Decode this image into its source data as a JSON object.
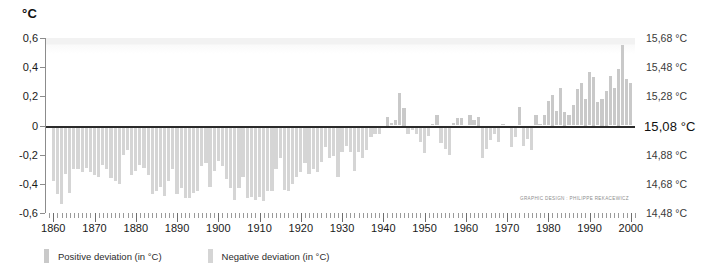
{
  "unit_label": "°C",
  "credit": "GRAPHIC DESIGN : PHILIPPE REKACEWICZ",
  "legend": {
    "items": [
      {
        "label": "Positive deviation (in °C)",
        "color": "#c9c9c9",
        "name": "positive"
      },
      {
        "label": "Negative deviation (in °C)",
        "color": "#d5d5d5",
        "name": "negative"
      }
    ]
  },
  "axes": {
    "left_ticks": [
      "0,6",
      "0,4",
      "0,2",
      "0",
      "-0,2",
      "-0,4",
      "-0,6"
    ],
    "left_values": [
      0.6,
      0.4,
      0.2,
      0,
      -0.2,
      -0.4,
      -0.6
    ],
    "right_ticks": [
      "15,68 °C",
      "15,48 °C",
      "15,28 °C",
      "15,08 °C",
      "14,88 °C",
      "14,68 °C",
      "14,48 °C"
    ],
    "right_values": [
      0.6,
      0.4,
      0.2,
      0,
      -0.2,
      -0.4,
      -0.6
    ],
    "x_ticks": [
      "1860",
      "1870",
      "1880",
      "1890",
      "1900",
      "1910",
      "1920",
      "1930",
      "1940",
      "1950",
      "1960",
      "1970",
      "1980",
      "1990",
      "2000"
    ],
    "x_values": [
      1860,
      1870,
      1880,
      1890,
      1900,
      1910,
      1920,
      1930,
      1940,
      1950,
      1960,
      1970,
      1980,
      1990,
      2000
    ]
  },
  "chart_data": {
    "type": "bar",
    "title": "",
    "xlabel": "",
    "ylabel": "°C",
    "xlim": [
      1858,
      2001
    ],
    "ylim": [
      -0.6,
      0.6
    ],
    "grid": false,
    "legend_position": "bottom-left",
    "baseline": 0,
    "baseline_absolute_temperature": 15.08,
    "secondary_axis_label": "°C",
    "x": [
      1860,
      1861,
      1862,
      1863,
      1864,
      1865,
      1866,
      1867,
      1868,
      1869,
      1870,
      1871,
      1872,
      1873,
      1874,
      1875,
      1876,
      1877,
      1878,
      1879,
      1880,
      1881,
      1882,
      1883,
      1884,
      1885,
      1886,
      1887,
      1888,
      1889,
      1890,
      1891,
      1892,
      1893,
      1894,
      1895,
      1896,
      1897,
      1898,
      1899,
      1900,
      1901,
      1902,
      1903,
      1904,
      1905,
      1906,
      1907,
      1908,
      1909,
      1910,
      1911,
      1912,
      1913,
      1914,
      1915,
      1916,
      1917,
      1918,
      1919,
      1920,
      1921,
      1922,
      1923,
      1924,
      1925,
      1926,
      1927,
      1928,
      1929,
      1930,
      1931,
      1932,
      1933,
      1934,
      1935,
      1936,
      1937,
      1938,
      1939,
      1940,
      1941,
      1942,
      1943,
      1944,
      1945,
      1946,
      1947,
      1948,
      1949,
      1950,
      1951,
      1952,
      1953,
      1954,
      1955,
      1956,
      1957,
      1958,
      1959,
      1960,
      1961,
      1962,
      1963,
      1964,
      1965,
      1966,
      1967,
      1968,
      1969,
      1970,
      1971,
      1972,
      1973,
      1974,
      1975,
      1976,
      1977,
      1978,
      1979,
      1980,
      1981,
      1982,
      1983,
      1984,
      1985,
      1986,
      1987,
      1988,
      1989,
      1990,
      1991,
      1992,
      1993,
      1994,
      1995,
      1996,
      1997,
      1998,
      1999,
      2000
    ],
    "values": [
      -0.38,
      -0.47,
      -0.54,
      -0.33,
      -0.46,
      -0.3,
      -0.3,
      -0.32,
      -0.29,
      -0.32,
      -0.34,
      -0.35,
      -0.27,
      -0.3,
      -0.36,
      -0.38,
      -0.4,
      -0.2,
      -0.17,
      -0.34,
      -0.31,
      -0.27,
      -0.29,
      -0.34,
      -0.47,
      -0.45,
      -0.42,
      -0.48,
      -0.38,
      -0.3,
      -0.47,
      -0.43,
      -0.5,
      -0.5,
      -0.46,
      -0.45,
      -0.28,
      -0.26,
      -0.42,
      -0.31,
      -0.24,
      -0.28,
      -0.37,
      -0.43,
      -0.51,
      -0.43,
      -0.35,
      -0.5,
      -0.49,
      -0.51,
      -0.49,
      -0.52,
      -0.45,
      -0.45,
      -0.3,
      -0.22,
      -0.44,
      -0.45,
      -0.4,
      -0.35,
      -0.32,
      -0.26,
      -0.33,
      -0.3,
      -0.32,
      -0.25,
      -0.15,
      -0.22,
      -0.21,
      -0.35,
      -0.18,
      -0.14,
      -0.18,
      -0.31,
      -0.18,
      -0.22,
      -0.17,
      -0.08,
      -0.06,
      -0.06,
      -0.01,
      0.06,
      0.02,
      0.04,
      0.22,
      0.12,
      -0.06,
      -0.03,
      -0.06,
      -0.11,
      -0.19,
      -0.07,
      0.01,
      0.07,
      -0.12,
      -0.16,
      -0.2,
      0.02,
      0.05,
      0.05,
      -0.01,
      0.07,
      0.04,
      0.06,
      -0.22,
      -0.16,
      -0.1,
      -0.06,
      -0.11,
      0.01,
      0.0,
      -0.15,
      -0.08,
      0.13,
      -0.14,
      -0.09,
      -0.17,
      0.07,
      0.01,
      0.07,
      0.17,
      0.21,
      0.1,
      0.26,
      0.09,
      0.07,
      0.14,
      0.25,
      0.29,
      0.18,
      0.37,
      0.33,
      0.16,
      0.18,
      0.24,
      0.34,
      0.26,
      0.39,
      0.55,
      0.32,
      0.29
    ],
    "series": [
      {
        "name": "Positive deviation (in °C)",
        "color": "#c9c9c9"
      },
      {
        "name": "Negative deviation (in °C)",
        "color": "#d5d5d5"
      }
    ]
  }
}
